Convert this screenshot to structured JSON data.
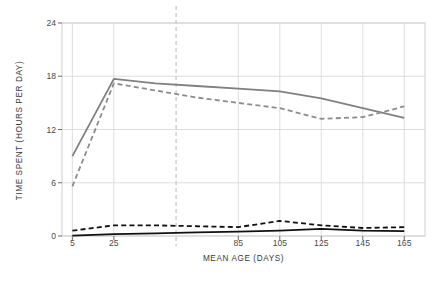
{
  "chart_data": {
    "type": "line",
    "title": "",
    "xlabel": "MEAN AGE (DAYS)",
    "ylabel": "TIME SPENT (HOURS PER DAY)",
    "x": [
      5,
      25,
      45,
      65,
      85,
      105,
      125,
      145,
      165
    ],
    "xlim": [
      0,
      175
    ],
    "ylim": [
      0,
      24
    ],
    "xticks": [
      5,
      25,
      85,
      105,
      125,
      145,
      165
    ],
    "xtick_labels": [
      "5",
      "25",
      "85",
      "105",
      "125",
      "145",
      "165"
    ],
    "yticks": [
      0,
      6,
      12,
      18,
      24
    ],
    "ytick_labels": [
      "0",
      "6",
      "12",
      "18",
      "24"
    ],
    "grid": true,
    "legend": "none",
    "reference_line_x": 55,
    "reference_line_style": "dashed",
    "reference_line_color": "#c9c9c9",
    "series": [
      {
        "name": "gray-solid",
        "style": "solid",
        "color": "#808080",
        "width": 1.8,
        "values": [
          9.0,
          17.7,
          17.2,
          16.9,
          16.6,
          16.3,
          15.5,
          14.4,
          13.3
        ]
      },
      {
        "name": "gray-dashed",
        "style": "dashed",
        "color": "#8c8c8c",
        "width": 1.8,
        "values": [
          5.6,
          17.2,
          16.4,
          15.6,
          15.0,
          14.4,
          13.2,
          13.4,
          14.6
        ]
      },
      {
        "name": "black-dashed",
        "style": "dashed",
        "color": "#111111",
        "width": 1.8,
        "values": [
          0.6,
          1.2,
          1.2,
          1.1,
          1.0,
          1.7,
          1.2,
          0.9,
          1.0
        ]
      },
      {
        "name": "black-solid",
        "style": "solid",
        "color": "#111111",
        "width": 1.8,
        "values": [
          0.05,
          0.2,
          0.3,
          0.4,
          0.5,
          0.6,
          0.8,
          0.6,
          0.55
        ]
      }
    ]
  },
  "axes": {
    "frame_color": "#d4d4d4",
    "grid_color": "#d9d9d9",
    "text_color": "#3a3a3a"
  }
}
